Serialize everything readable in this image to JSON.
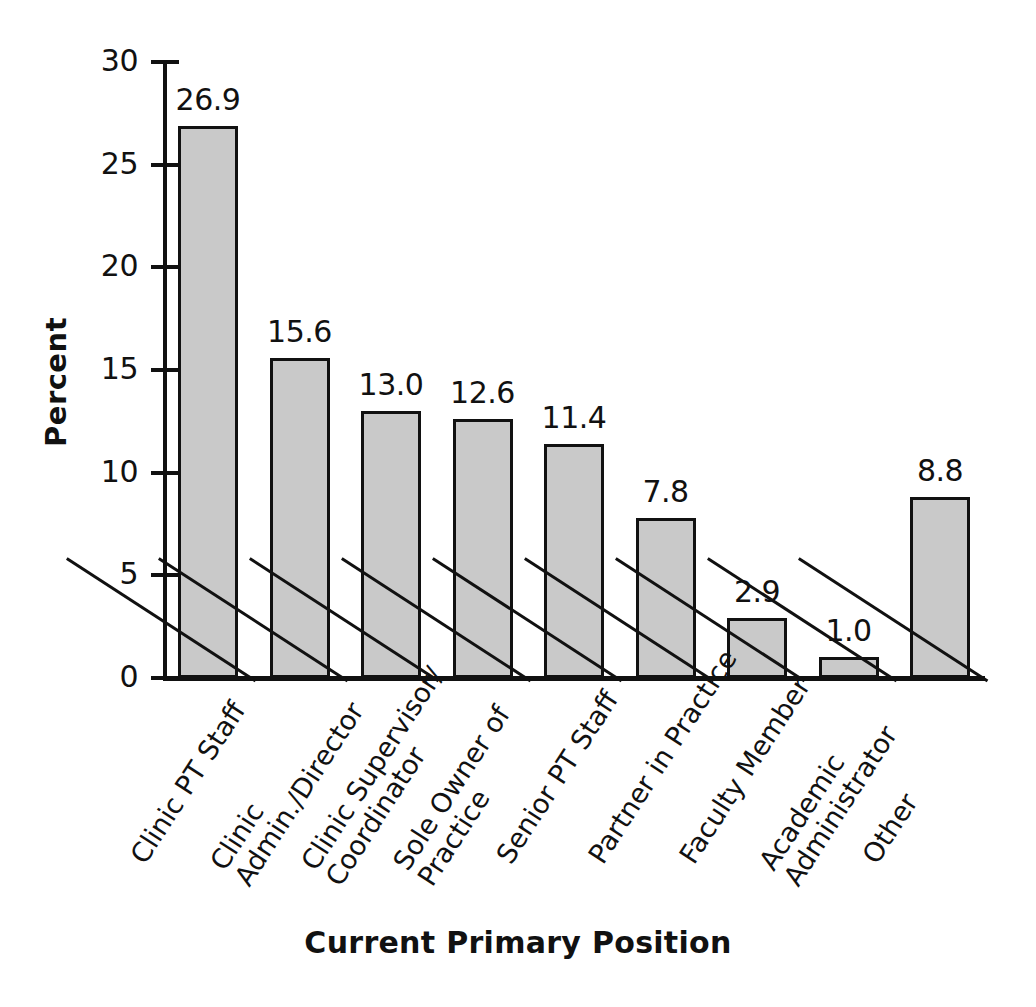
{
  "chart_data": {
    "type": "bar",
    "title": "",
    "xlabel": "Current Primary Position",
    "ylabel": "Percent",
    "ylim": [
      0,
      30
    ],
    "yticks": [
      "0",
      "5",
      "10",
      "15",
      "20",
      "25",
      "30"
    ],
    "grid": false,
    "legend": "none",
    "categories": [
      "Clinic PT Staff",
      "Clinic Admin./Director",
      "Clinic Supervisor/ Coordinator",
      "Sole Owner of Practice",
      "Senior PT Staff",
      "Partner in Practice",
      "Faculty Member",
      "Academic Administrator",
      "Other"
    ],
    "category_lines": [
      [
        "Clinic PT Staff",
        ""
      ],
      [
        "Clinic",
        "Admin./Director"
      ],
      [
        "Clinic Supervisor/",
        "Coordinator"
      ],
      [
        "Sole Owner of",
        "Practice"
      ],
      [
        "Senior PT Staff",
        ""
      ],
      [
        "Partner in Practice",
        ""
      ],
      [
        "Faculty Member",
        ""
      ],
      [
        "Academic",
        "Administrator"
      ],
      [
        "Other",
        ""
      ]
    ],
    "values": [
      26.9,
      15.6,
      13.0,
      12.6,
      11.4,
      7.8,
      2.9,
      1.0,
      8.8
    ],
    "value_labels": [
      "26.9",
      "15.6",
      "13.0",
      "12.6",
      "11.4",
      "7.8",
      "2.9",
      "1.0",
      "8.8"
    ],
    "bar_fill": "#c9c9c9",
    "bar_stroke": "#111111",
    "axis_color": "#111111"
  }
}
